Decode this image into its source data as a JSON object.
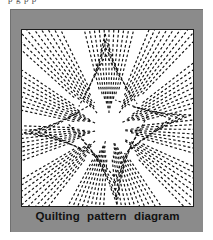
{
  "page": {
    "background_color": "#ffffff",
    "top_cropped_text": "p   g          p           p"
  },
  "figure": {
    "panel_color": "#8b8b8b",
    "panel_border_color": "#707070",
    "box_background": "#ffffff",
    "box_border_color": "#1c1c1c",
    "caption": "Quilting pattern diagram",
    "caption_color": "#111111"
  },
  "chart_data": {
    "type": "diagram",
    "title": "Quilting pattern diagram",
    "line_style": "dashed",
    "stroke_color": "#111111",
    "stroke_width": 1.15,
    "dash_pattern": "2.6 2.2",
    "canvas": {
      "width": 173,
      "height": 178
    },
    "center": {
      "x": 88,
      "y": 100
    },
    "fans": [
      {
        "name": "fan-n",
        "angle_start": -104,
        "angle_end": -76,
        "count": 11,
        "void_after": true
      },
      {
        "name": "fan-nne",
        "angle_start": -68,
        "angle_end": -46,
        "count": 9,
        "void_after": true
      },
      {
        "name": "fan-ne",
        "angle_start": -38,
        "angle_end": -14,
        "count": 9,
        "void_after": true
      },
      {
        "name": "fan-e",
        "angle_start": -6,
        "angle_end": 16,
        "count": 8,
        "void_after": true
      },
      {
        "name": "fan-ese",
        "angle_start": 24,
        "angle_end": 46,
        "count": 8,
        "void_after": true
      },
      {
        "name": "fan-s",
        "angle_start": 56,
        "angle_end": 84,
        "count": 10,
        "void_after": true
      },
      {
        "name": "fan-ssw",
        "angle_start": 94,
        "angle_end": 118,
        "count": 9,
        "void_after": true
      },
      {
        "name": "fan-sw",
        "angle_start": 128,
        "angle_end": 150,
        "count": 9,
        "void_after": true
      },
      {
        "name": "fan-w",
        "angle_start": 160,
        "angle_end": 182,
        "count": 9,
        "void_after": true
      },
      {
        "name": "fan-wnw",
        "angle_start": 192,
        "angle_end": 214,
        "count": 9,
        "void_after": true
      },
      {
        "name": "fan-nw",
        "angle_start": 222,
        "angle_end": 244,
        "count": 9,
        "void_after": true
      }
    ],
    "chevrons": [
      {
        "name": "chevron-bottom-center",
        "apex_x": 96,
        "apex_y": 176,
        "spread": 30,
        "rings": 5
      },
      {
        "name": "chevron-top-center",
        "apex_x": 84,
        "apex_y": 4,
        "spread": 30,
        "rings": 4
      },
      {
        "name": "chevron-left-mid",
        "apex_x": 2,
        "apex_y": 104,
        "spread": 26,
        "rings": 4
      },
      {
        "name": "chevron-right-mid",
        "apex_x": 171,
        "apex_y": 86,
        "spread": 26,
        "rings": 4
      }
    ]
  }
}
